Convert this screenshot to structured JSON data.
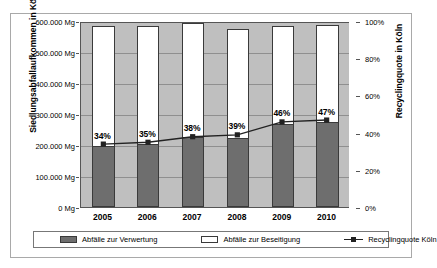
{
  "chart_data": {
    "type": "bar",
    "title": "",
    "subtitle": "",
    "xlabel": "",
    "ylabel": "Siedlungsabfallaufkommen in Köln",
    "y2label": "Recyclingquote in Köln",
    "categories": [
      "2005",
      "2006",
      "2007",
      "2008",
      "2009",
      "2010"
    ],
    "ylim": [
      0,
      600000
    ],
    "y2lim": [
      0,
      100
    ],
    "yticks": [
      "0 Mg",
      "100.000 Mg",
      "200.000 Mg",
      "300.000 Mg",
      "400.000 Mg",
      "500.000 Mg",
      "600.000 Mg"
    ],
    "ytick_values": [
      0,
      100000,
      200000,
      300000,
      400000,
      500000,
      600000
    ],
    "y2ticks": [
      "0%",
      "20%",
      "40%",
      "60%",
      "80%",
      "100%"
    ],
    "y2tick_values": [
      0,
      20,
      40,
      60,
      80,
      100
    ],
    "grid": true,
    "legend_position": "bottom",
    "series": [
      {
        "name": "Abfälle zur Verwertung",
        "type": "bar",
        "axis": "left",
        "color": "#6e6e6e",
        "values": [
          198000,
          203000,
          225000,
          222000,
          268000,
          275000
        ]
      },
      {
        "name": "Abfälle zur Beseitigung",
        "type": "bar",
        "axis": "left",
        "color": "#ffffff",
        "values": [
          385000,
          380000,
          390000,
          362000,
          315000,
          312000
        ]
      },
      {
        "name": "Recyclingquote Köln",
        "type": "line",
        "axis": "right",
        "color": "#222222",
        "values": [
          34,
          35,
          38,
          39,
          46,
          47
        ],
        "labels": [
          "34%",
          "35%",
          "38%",
          "39%",
          "46%",
          "47%"
        ]
      }
    ],
    "bar_totals": [
      583000,
      583000,
      592000,
      573000,
      583000,
      587000
    ]
  },
  "legend": {
    "items": [
      {
        "label": "Abfälle zur Verwertung",
        "marker": "filled-square-swatch"
      },
      {
        "label": "Abfälle zur Beseitigung",
        "marker": "hollow-square-swatch"
      },
      {
        "label": "Recyclingquote Köln",
        "marker": "line-marker-swatch"
      }
    ]
  },
  "colors": {
    "plot_background": "#bfbfbf",
    "bar_recycling": "#6e6e6e",
    "bar_disposal": "#ffffff",
    "line": "#222222",
    "gridline": "#8f8f8f",
    "axis": "#555555",
    "frame": "#a9a9a9"
  }
}
